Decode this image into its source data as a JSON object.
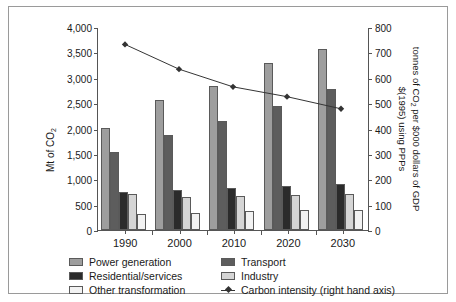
{
  "chart_data": {
    "type": "bar",
    "title": "",
    "categories": [
      "1990",
      "2000",
      "2010",
      "2020",
      "2030"
    ],
    "xlabel": "",
    "ylabel": "Mt of CO2",
    "ylabel_display": "Mt of CO",
    "ylabel_sub": "2",
    "ylim": [
      0,
      4000
    ],
    "yticks": [
      "0",
      "500",
      "1,000",
      "1,500",
      "2,000",
      "2,500",
      "3,000",
      "3,500",
      "4,000"
    ],
    "ytick_values": [
      0,
      500,
      1000,
      1500,
      2000,
      2500,
      3000,
      3500,
      4000
    ],
    "y2label_line1_a": "tonnes of CO",
    "y2label_line1_sub": "2",
    "y2label_line1_b": " per $000 dollars of GDP",
    "y2label_line2": "$(1995) using PPPs",
    "y2lim": [
      0,
      800
    ],
    "y2ticks": [
      "0",
      "100",
      "200",
      "300",
      "400",
      "500",
      "600",
      "700",
      "800"
    ],
    "y2tick_values": [
      0,
      100,
      200,
      300,
      400,
      500,
      600,
      700,
      800
    ],
    "grid": false,
    "legend_position": "bottom",
    "series": [
      {
        "name": "Power generation",
        "axis": "left",
        "type": "bar",
        "color": "#9e9e9e",
        "values": [
          2010,
          2570,
          2840,
          3300,
          3565
        ]
      },
      {
        "name": "Transport",
        "axis": "left",
        "type": "bar",
        "color": "#5d5d5d",
        "values": [
          1540,
          1870,
          2150,
          2450,
          2780
        ]
      },
      {
        "name": "Residential/services",
        "axis": "left",
        "type": "bar",
        "color": "#2b2b2b",
        "values": [
          755,
          780,
          835,
          865,
          905
        ]
      },
      {
        "name": "Industry",
        "axis": "left",
        "type": "bar",
        "color": "#d5d5d5",
        "values": [
          705,
          645,
          665,
          685,
          710
        ]
      },
      {
        "name": "Other transformation",
        "axis": "left",
        "type": "bar",
        "color": "#f2f2f2",
        "values": [
          320,
          335,
          370,
          385,
          400
        ]
      },
      {
        "name": "Carbon intensity (right hand axis)",
        "axis": "right",
        "type": "line",
        "color": "#333333",
        "values": [
          735,
          637,
          567,
          528,
          480
        ]
      }
    ]
  },
  "legend": {
    "items": [
      {
        "label": "Power generation",
        "marker": "swatch",
        "color": "#9e9e9e"
      },
      {
        "label": "Transport",
        "marker": "swatch",
        "color": "#5d5d5d"
      },
      {
        "label": "Residential/services",
        "marker": "swatch",
        "color": "#2b2b2b"
      },
      {
        "label": "Industry",
        "marker": "swatch",
        "color": "#d5d5d5"
      },
      {
        "label": "Other transformation",
        "marker": "swatch",
        "color": "#f2f2f2"
      },
      {
        "label": "Carbon intensity (right hand axis)",
        "marker": "line-diamond",
        "color": "#333333"
      }
    ]
  }
}
